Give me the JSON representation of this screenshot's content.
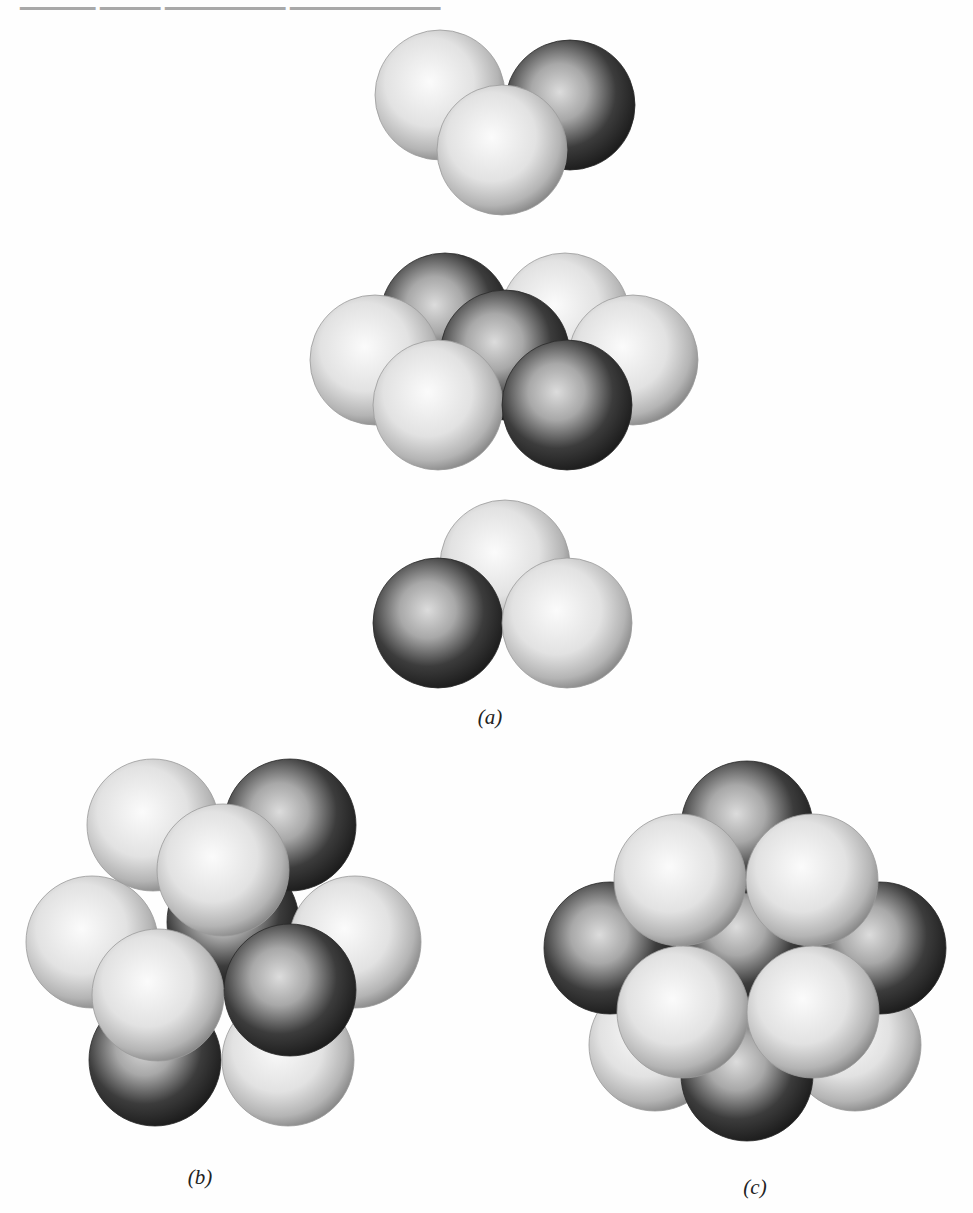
{
  "figure": {
    "panels": [
      {
        "id": "a",
        "label": "(a)",
        "description": "Exploded view of three close-packed layers",
        "layers": [
          {
            "name": "top-layer",
            "spheres": [
              {
                "cx": 440,
                "cy": 95,
                "shade": "light"
              },
              {
                "cx": 570,
                "cy": 105,
                "shade": "dark"
              },
              {
                "cx": 502,
                "cy": 150,
                "shade": "light"
              }
            ]
          },
          {
            "name": "middle-layer",
            "spheres": [
              {
                "cx": 445,
                "cy": 318,
                "shade": "dark"
              },
              {
                "cx": 565,
                "cy": 318,
                "shade": "light"
              },
              {
                "cx": 375,
                "cy": 360,
                "shade": "light"
              },
              {
                "cx": 633,
                "cy": 360,
                "shade": "light"
              },
              {
                "cx": 505,
                "cy": 355,
                "shade": "dark"
              },
              {
                "cx": 438,
                "cy": 405,
                "shade": "light"
              },
              {
                "cx": 567,
                "cy": 405,
                "shade": "dark"
              }
            ]
          },
          {
            "name": "bottom-layer",
            "spheres": [
              {
                "cx": 505,
                "cy": 565,
                "shade": "light"
              },
              {
                "cx": 438,
                "cy": 623,
                "shade": "dark"
              },
              {
                "cx": 567,
                "cy": 623,
                "shade": "light"
              }
            ]
          }
        ]
      },
      {
        "id": "b",
        "label": "(b)",
        "description": "Assembled cluster viewed along stacking axis",
        "spheres": [
          {
            "cx": 233,
            "cy": 922,
            "shade": "dark"
          },
          {
            "cx": 153,
            "cy": 825,
            "shade": "light"
          },
          {
            "cx": 290,
            "cy": 825,
            "shade": "dark"
          },
          {
            "cx": 155,
            "cy": 1060,
            "shade": "dark"
          },
          {
            "cx": 288,
            "cy": 1060,
            "shade": "light"
          },
          {
            "cx": 92,
            "cy": 942,
            "shade": "light"
          },
          {
            "cx": 355,
            "cy": 942,
            "shade": "light"
          },
          {
            "cx": 223,
            "cy": 870,
            "shade": "light"
          },
          {
            "cx": 158,
            "cy": 995,
            "shade": "light"
          },
          {
            "cx": 290,
            "cy": 990,
            "shade": "dark"
          }
        ]
      },
      {
        "id": "c",
        "label": "(c)",
        "description": "Assembled cluster viewed along cubic axis",
        "spheres": [
          {
            "cx": 747,
            "cy": 940,
            "shade": "dark"
          },
          {
            "cx": 655,
            "cy": 1045,
            "shade": "light"
          },
          {
            "cx": 855,
            "cy": 1045,
            "shade": "light"
          },
          {
            "cx": 747,
            "cy": 827,
            "shade": "dark"
          },
          {
            "cx": 610,
            "cy": 948,
            "shade": "dark"
          },
          {
            "cx": 880,
            "cy": 948,
            "shade": "dark"
          },
          {
            "cx": 747,
            "cy": 1075,
            "shade": "dark"
          },
          {
            "cx": 680,
            "cy": 880,
            "shade": "light"
          },
          {
            "cx": 812,
            "cy": 880,
            "shade": "light"
          },
          {
            "cx": 683,
            "cy": 1012,
            "shade": "light"
          },
          {
            "cx": 813,
            "cy": 1012,
            "shade": "light"
          }
        ]
      }
    ],
    "colors": {
      "light_highlight": "#fbfbfb",
      "light_mid": "#dcdcdc",
      "light_edge": "#8a8a8a",
      "dark_highlight": "#d8d8d8",
      "dark_mid": "#5a5a5a",
      "dark_edge": "#1c1c1c"
    }
  }
}
